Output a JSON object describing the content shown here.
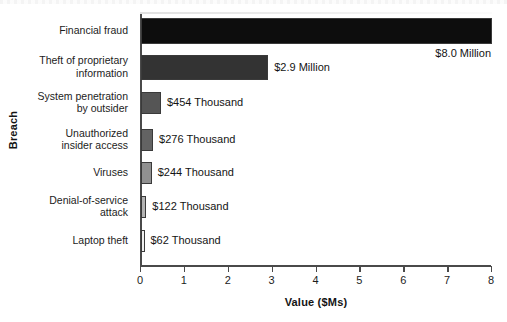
{
  "chart_data": {
    "type": "bar",
    "orientation": "horizontal",
    "title": "",
    "xlabel": "Value ($Ms)",
    "ylabel": "Breach",
    "xlim": [
      0,
      8
    ],
    "xticks": [
      "0",
      "1",
      "2",
      "3",
      "4",
      "5",
      "6",
      "7",
      "8"
    ],
    "grid": false,
    "legend": "none",
    "categories": [
      "Financial fraud",
      "Theft of proprietary information",
      "System penetration by outsider",
      "Unauthorized insider access",
      "Viruses",
      "Denial-of-service attack",
      "Laptop theft"
    ],
    "values": [
      8.0,
      2.9,
      0.454,
      0.276,
      0.244,
      0.122,
      0.062
    ],
    "value_labels": [
      "$8.0 Million",
      "$2.9 Million",
      "$454 Thousand",
      "$276 Thousand",
      "$244 Thousand",
      "$122 Thousand",
      "$62 Thousand"
    ],
    "bar_colors": [
      "#0d0d0d",
      "#333333",
      "#555555",
      "#636363",
      "#909090",
      "#b4b4b4",
      "#f0f0f0"
    ],
    "bar_edge_color": "#3a3a3a"
  },
  "axes": {
    "y_axis_title": "Breach",
    "x_axis_title": "Value ($Ms)",
    "tick_labels": [
      "0",
      "1",
      "2",
      "3",
      "4",
      "5",
      "6",
      "7",
      "8"
    ]
  },
  "category_lines": [
    [
      "Financial fraud"
    ],
    [
      "Theft of proprietary",
      "information"
    ],
    [
      "System penetration",
      "by outsider"
    ],
    [
      "Unauthorized",
      "insider access"
    ],
    [
      "Viruses"
    ],
    [
      "Denial-of-service",
      "attack"
    ],
    [
      "Laptop theft"
    ]
  ]
}
